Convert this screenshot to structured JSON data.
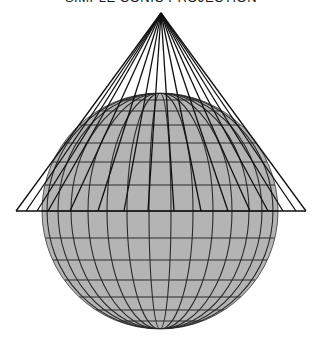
{
  "title": "SIMPLE CONIC PROJECTION",
  "colors": {
    "background": "#ffffff",
    "sphere_fill": "#b4b4b4",
    "graticule": "#2a2a2a",
    "cone_lines": "#111111"
  },
  "sphere": {
    "cx": 160,
    "cy": 211,
    "r": 118,
    "parallel_offsets": [
      -111,
      -100,
      -86,
      -68,
      -49,
      -26,
      0,
      27,
      49,
      69,
      86,
      99,
      110
    ],
    "meridian_offsets": [
      -113,
      -102,
      -89,
      -72,
      -53,
      -33,
      -11,
      11,
      33,
      53,
      72,
      89,
      102,
      113
    ]
  },
  "cone": {
    "apex": [
      161,
      13
    ],
    "base_y": 211,
    "base_x": [
      16,
      26,
      37,
      48,
      70,
      98,
      124,
      148,
      174,
      201,
      228,
      250,
      268,
      283,
      296,
      306
    ]
  }
}
